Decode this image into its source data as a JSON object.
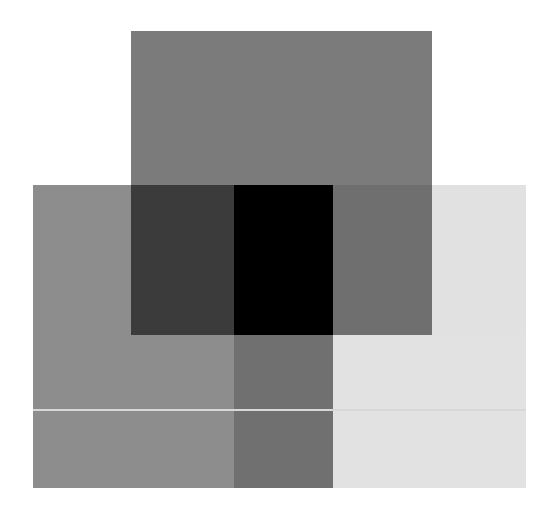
{
  "canvas": {
    "width": 545,
    "height": 516,
    "background": "#ffffff"
  },
  "blocks": [
    {
      "name": "top-rectangle",
      "x": 131,
      "y": 31,
      "w": 301,
      "h": 154,
      "color": "#7b7b7b"
    },
    {
      "name": "lower-left-region",
      "x": 33,
      "y": 185,
      "w": 98,
      "h": 303,
      "color": "#8d8d8d"
    },
    {
      "name": "lower-left-under-top",
      "x": 131,
      "y": 335,
      "w": 103,
      "h": 153,
      "color": "#8d8d8d"
    },
    {
      "name": "dark-overlap",
      "x": 131,
      "y": 185,
      "w": 103,
      "h": 150,
      "color": "#3b3b3b"
    },
    {
      "name": "black-overlap",
      "x": 234,
      "y": 185,
      "w": 99,
      "h": 150,
      "color": "#000000"
    },
    {
      "name": "mid-grey-overlap",
      "x": 333,
      "y": 185,
      "w": 99,
      "h": 150,
      "color": "#6f6f6f"
    },
    {
      "name": "light-right-region",
      "x": 432,
      "y": 185,
      "w": 94,
      "h": 150,
      "color": "#e1e1e1"
    },
    {
      "name": "middle-column-lower",
      "x": 234,
      "y": 335,
      "w": 99,
      "h": 153,
      "color": "#707070"
    },
    {
      "name": "light-lower-right",
      "x": 333,
      "y": 335,
      "w": 193,
      "h": 153,
      "color": "#e2e2e2"
    },
    {
      "name": "horizontal-light-line",
      "x": 33,
      "y": 409,
      "w": 493,
      "h": 2,
      "color": "#d8d8d8"
    }
  ]
}
